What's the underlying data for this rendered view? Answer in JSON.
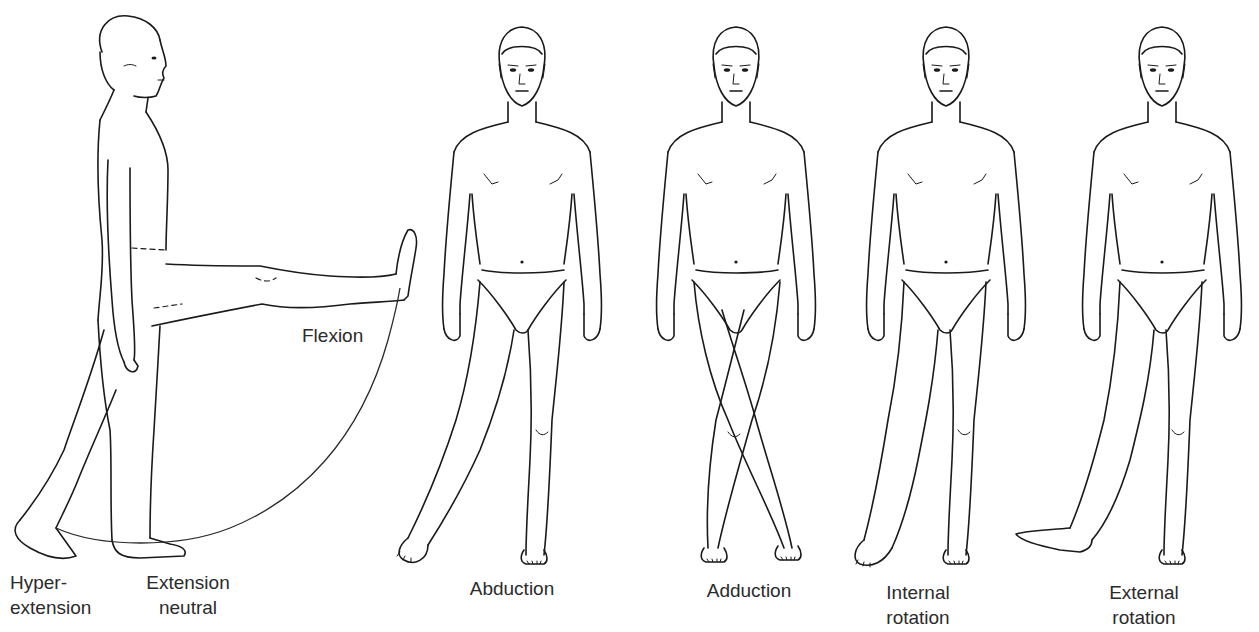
{
  "diagram": {
    "ink_color": "#1a1a1a",
    "background": "#ffffff",
    "figures": [
      {
        "id": "lateral",
        "view": "side",
        "labels": {
          "flexion": "Flexion",
          "hyperextension": [
            "Hyper-",
            "extension"
          ],
          "extension_neutral": [
            "Extension",
            "neutral"
          ]
        }
      },
      {
        "id": "abduction",
        "view": "front",
        "label": [
          "Abduction"
        ]
      },
      {
        "id": "adduction",
        "view": "front",
        "label": [
          "Adduction"
        ]
      },
      {
        "id": "internal_rotation",
        "view": "front",
        "label": [
          "Internal",
          "rotation"
        ]
      },
      {
        "id": "external_rotation",
        "view": "front",
        "label": [
          "External",
          "rotation"
        ]
      }
    ]
  }
}
